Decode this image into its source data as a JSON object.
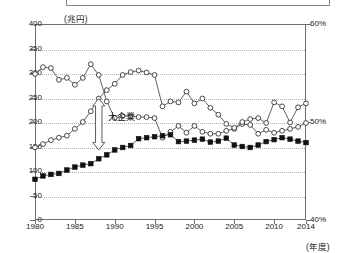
{
  "axes": {
    "left_unit_label": "(兆円)",
    "bottom_right_unit_label": "(年度)",
    "left_ticks": [
      "400",
      "350",
      "300",
      "250",
      "200",
      "150",
      "100",
      "50",
      "0"
    ],
    "right_ticks": [
      "60%",
      "50%",
      "40%"
    ],
    "x_ticks": [
      "1980",
      "1985",
      "1990",
      "1995",
      "2000",
      "2005",
      "2010",
      "2014"
    ]
  },
  "annotation": {
    "label": "大企業"
  },
  "colors": {
    "frame": "#6d6d6d",
    "gridline": "#c9a9a9",
    "series_open": "#2b2b2b",
    "series_filled": "#111111",
    "background": "#ffffff"
  },
  "chart_data": {
    "type": "line",
    "title": "",
    "subtitle": "",
    "xlabel": "(年度)",
    "ylabel": "(兆円)",
    "y2label": "%",
    "ylim": [
      0,
      400
    ],
    "y2lim": [
      40,
      60
    ],
    "xlim": [
      1980,
      2014
    ],
    "grid": true,
    "legend_position": "none",
    "x": [
      1980,
      1981,
      1982,
      1983,
      1984,
      1985,
      1986,
      1987,
      1988,
      1989,
      1990,
      1991,
      1992,
      1993,
      1994,
      1995,
      1996,
      1997,
      1998,
      1999,
      2000,
      2001,
      2002,
      2003,
      2004,
      2005,
      2006,
      2007,
      2008,
      2009,
      2010,
      2011,
      2012,
      2013,
      2014
    ],
    "series": [
      {
        "name": "ratio-open-circle-declining",
        "axis": "right",
        "marker": "open-circle",
        "values": [
          54.9,
          55.6,
          55.5,
          54.3,
          54.5,
          53.8,
          54.5,
          55.9,
          54.8,
          52.1,
          50.4,
          50.6,
          50.6,
          50.5,
          50.5,
          50.4,
          48.4,
          49.0,
          49.6,
          48.9,
          49.6,
          49.0,
          48.8,
          48.8,
          49.1,
          49.3,
          49.8,
          49.7,
          48.8,
          49.2,
          48.9,
          49.1,
          49.3,
          49.5,
          49.9
        ]
      },
      {
        "name": "amount-open-circle-rising",
        "axis": "left",
        "marker": "open-circle",
        "values": [
          148,
          155,
          163,
          168,
          172,
          186,
          200,
          222,
          248,
          265,
          278,
          296,
          302,
          305,
          301,
          296,
          232,
          242,
          240,
          262,
          238,
          248,
          229,
          215,
          196,
          188,
          200,
          206,
          208,
          198,
          240,
          232,
          199,
          230,
          238
        ]
      },
      {
        "name": "amount-filled-square",
        "axis": "left",
        "marker": "filled-square",
        "values": [
          83,
          90,
          93,
          95,
          102,
          108,
          112,
          115,
          125,
          133,
          143,
          148,
          152,
          166,
          168,
          170,
          172,
          174,
          160,
          161,
          163,
          165,
          159,
          161,
          167,
          153,
          150,
          148,
          153,
          160,
          164,
          168,
          165,
          161,
          158
        ]
      }
    ]
  }
}
